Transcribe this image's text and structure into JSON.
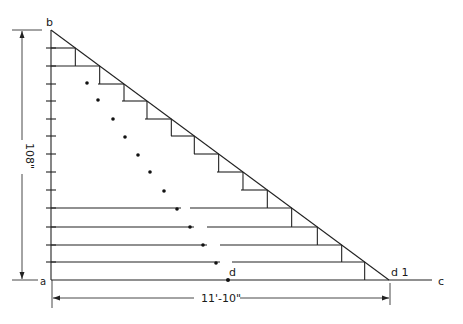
{
  "diagram": {
    "type": "stair-stringer-layout",
    "points": {
      "a": {
        "label": "a",
        "x": 51,
        "y": 280
      },
      "b": {
        "label": "b",
        "x": 51,
        "y": 30
      },
      "c": {
        "label": "c",
        "x": 440,
        "y": 280
      },
      "d": {
        "label": "d",
        "x": 228,
        "y": 280
      },
      "d1": {
        "label": "d 1",
        "x": 389,
        "y": 280
      }
    },
    "dimensions": {
      "height": {
        "label": "108\"",
        "x": 22,
        "y1": 30,
        "y2": 280
      },
      "run": {
        "label": "11'-10\"",
        "y": 298,
        "x1": 52,
        "x2": 390
      }
    },
    "ticks_y": [
      48,
      66,
      84,
      101,
      119,
      136,
      154,
      172,
      190,
      208,
      227,
      245,
      262
    ],
    "steps": [
      {
        "y": 48,
        "x_start": 51
      },
      {
        "y": 66,
        "x_start": 51
      },
      {
        "y": 84,
        "x_start": 98
      },
      {
        "y": 101,
        "x_start": 122
      },
      {
        "y": 119,
        "x_start": 145
      },
      {
        "y": 136,
        "x_start": 171
      },
      {
        "y": 154,
        "x_start": 194
      },
      {
        "y": 172,
        "x_start": 217
      },
      {
        "y": 190,
        "x_start": 241
      },
      {
        "y": 208,
        "x_start": 51,
        "gap": [
          181,
          190
        ]
      },
      {
        "y": 227,
        "x_start": 51,
        "gap": [
          194,
          207
        ]
      },
      {
        "y": 245,
        "x_start": 51,
        "gap": [
          207,
          220
        ]
      },
      {
        "y": 262,
        "x_start": 51,
        "gap": [
          220,
          232
        ]
      }
    ],
    "dots": [
      [
        87,
        83
      ],
      [
        98,
        100
      ],
      [
        113,
        119
      ],
      [
        125,
        137
      ],
      [
        138,
        155
      ],
      [
        150,
        172
      ],
      [
        164,
        191
      ],
      [
        177,
        209
      ],
      [
        190,
        227
      ],
      [
        203,
        245
      ],
      [
        216,
        263
      ]
    ]
  }
}
